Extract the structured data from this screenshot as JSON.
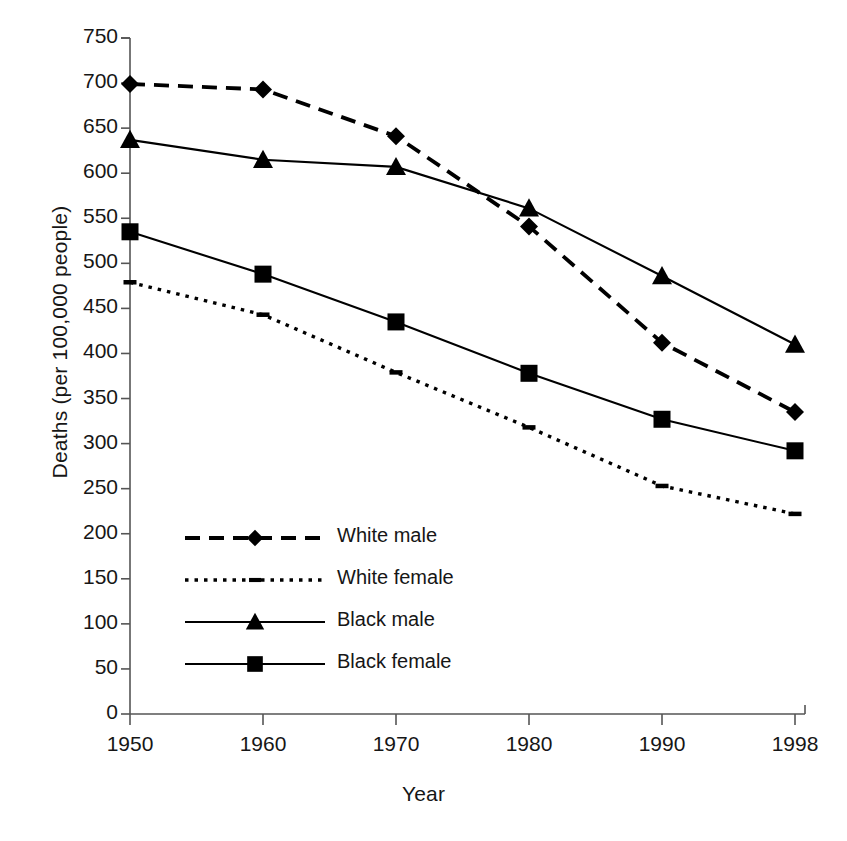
{
  "chart_data": {
    "type": "line",
    "title": "",
    "xlabel": "Year",
    "ylabel": "Deaths (per 100,000 people)",
    "categories": [
      "1950",
      "1960",
      "1970",
      "1980",
      "1990",
      "1998"
    ],
    "x": [
      1950,
      1960,
      1970,
      1980,
      1990,
      1998
    ],
    "xlim": [
      1950,
      1998
    ],
    "ylim": [
      0,
      750
    ],
    "ytick_labels": [
      "750",
      "700",
      "650",
      "600",
      "550",
      "500",
      "450",
      "400",
      "350",
      "300",
      "250",
      "200",
      "150",
      "100",
      "50",
      "0"
    ],
    "yticks": [
      750,
      700,
      650,
      600,
      550,
      500,
      450,
      400,
      350,
      300,
      250,
      200,
      150,
      100,
      50,
      0
    ],
    "ytick_step": 50,
    "grid": false,
    "legend_position": "inside-lower-left",
    "series": [
      {
        "name": "White male",
        "marker": "diamond",
        "line_style": "dashed",
        "color": "#000000",
        "values": [
          699,
          693,
          641,
          541,
          412,
          335
        ]
      },
      {
        "name": "White female",
        "marker": "dash",
        "line_style": "dotted",
        "color": "#000000",
        "values": [
          479,
          443,
          379,
          318,
          253,
          222
        ]
      },
      {
        "name": "Black male",
        "marker": "triangle",
        "line_style": "solid",
        "color": "#000000",
        "values": [
          637,
          615,
          607,
          561,
          486,
          410
        ]
      },
      {
        "name": "Black female",
        "marker": "square",
        "line_style": "solid",
        "color": "#000000",
        "values": [
          535,
          488,
          435,
          378,
          327,
          292
        ]
      }
    ]
  },
  "axes": {
    "x_title": "Year",
    "y_title": "Deaths (per 100,000 people)"
  },
  "legend": {
    "items": [
      {
        "label": "White male"
      },
      {
        "label": "White female"
      },
      {
        "label": "Black male"
      },
      {
        "label": "Black female"
      }
    ]
  },
  "colors": {
    "ink": "#161616",
    "axis": "#555555"
  }
}
